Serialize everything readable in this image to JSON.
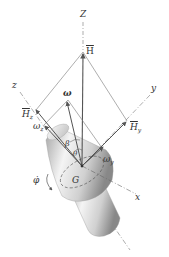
{
  "diagram": {
    "labels": {
      "Z": "Z",
      "H": "H",
      "z": "z",
      "y": "y",
      "x": "x",
      "omega": "ω",
      "Hz_main": "H",
      "Hz_sub": "z",
      "Hy_main": "H",
      "Hy_sub": "y",
      "omega_z_main": "ω",
      "omega_z_sub": "z",
      "omega_y_main": "ω",
      "omega_y_sub": "y",
      "beta": "β",
      "theta": "θ",
      "phi_dot": "φ̇",
      "G": "G"
    },
    "colors": {
      "line": "#555555",
      "axis_dash": "#777777",
      "body_light": "#f2f2f2",
      "body_mid": "#c8c8c8",
      "body_dark": "#8a8a8a"
    }
  }
}
